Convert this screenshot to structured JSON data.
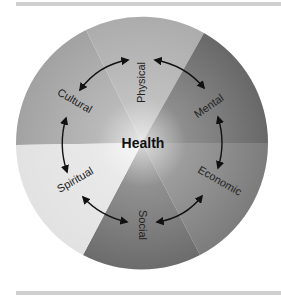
{
  "diagram": {
    "title": "Health",
    "center_label": "Health",
    "dimensions": [
      {
        "id": "physical",
        "label": "Physical",
        "color": "#acacac"
      },
      {
        "id": "mental",
        "label": "Mental",
        "color": "#686868"
      },
      {
        "id": "economic",
        "label": "Economic",
        "color": "#7c7c7c"
      },
      {
        "id": "social",
        "label": "Social",
        "color": "#6c6c6c"
      },
      {
        "id": "spiritual",
        "label": "Spiritual",
        "color": "#e2e2e2"
      },
      {
        "id": "cultural",
        "label": "Cultural",
        "color": "#a2a2a2"
      }
    ],
    "connections": [
      {
        "from": "Physical",
        "to": "Mental",
        "type": "bidirectional"
      },
      {
        "from": "Mental",
        "to": "Economic",
        "type": "bidirectional"
      },
      {
        "from": "Economic",
        "to": "Social",
        "type": "bidirectional"
      },
      {
        "from": "Social",
        "to": "Spiritual",
        "type": "bidirectional"
      },
      {
        "from": "Spiritual",
        "to": "Cultural",
        "type": "bidirectional"
      },
      {
        "from": "Cultural",
        "to": "Physical",
        "type": "bidirectional"
      }
    ]
  }
}
